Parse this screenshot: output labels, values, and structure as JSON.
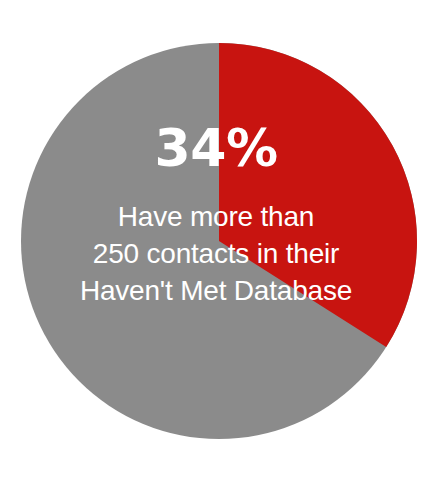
{
  "figure": {
    "background_color": "#ffffff",
    "label_text_color": "#ffffff"
  },
  "callout": {
    "percent_label": "34%",
    "caption_lines": [
      "Have more than",
      "250 contacts in their",
      "Haven't Met Database"
    ]
  },
  "chart_data": {
    "type": "pie",
    "title": "",
    "subtitle": "",
    "xlabel": "",
    "ylabel": "",
    "legend_position": "none",
    "grid": false,
    "start_angle_deg": 0,
    "direction": "clockwise",
    "center_px": [
      219,
      241
    ],
    "radius_px": 198,
    "categories": [
      "Have more than 250 contacts in their Haven't Met Database",
      "Other"
    ],
    "values": [
      34,
      66
    ],
    "value_unit": "percent",
    "colors": [
      "#c81410",
      "#8b8b8b"
    ],
    "slices": [
      {
        "name": "Have more than 250 contacts in their Haven't Met Database",
        "value": 34,
        "label": "34%",
        "color": "#c81410",
        "start_angle_deg": 0,
        "end_angle_deg": 122.4,
        "labeled": true
      },
      {
        "name": "Other",
        "value": 66,
        "label": "",
        "color": "#8b8b8b",
        "start_angle_deg": 122.4,
        "end_angle_deg": 360,
        "labeled": false
      }
    ],
    "annotations": [
      {
        "text": "34%",
        "role": "primary-value",
        "color": "#ffffff"
      },
      {
        "text": "Have more than 250 contacts in their Haven't Met Database",
        "role": "description",
        "color": "#ffffff"
      }
    ]
  }
}
